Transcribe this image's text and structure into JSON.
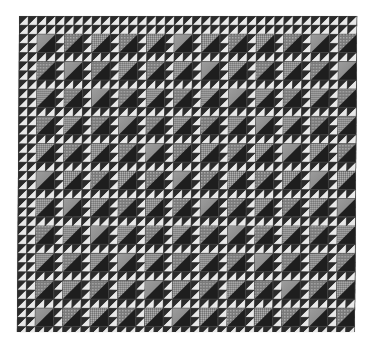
{
  "image": {
    "subject": "Quilt photograph",
    "pattern": "half-square triangle blocks",
    "description": "Black-and-white photograph of a pieced quilt made of large and small half-square triangles on a white background"
  },
  "quilt": {
    "block_columns": 12,
    "block_rows": 11,
    "block_size_px": 27.4,
    "small_unit_px": 9.13,
    "colors": {
      "dark": "#2b2b2b",
      "darker": "#1e1e1e",
      "light": "#e8e8e8",
      "patterned_light": "#9a9a9a",
      "patterned_mid": "#7c7c7c",
      "seam": "#555555",
      "background": "#ffffff"
    }
  }
}
